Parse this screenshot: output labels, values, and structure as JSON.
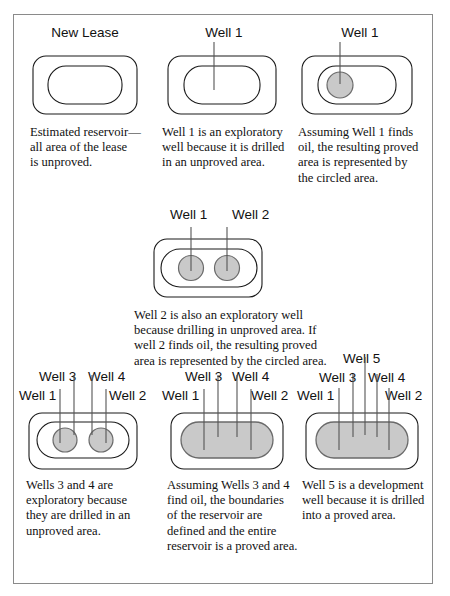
{
  "figure": {
    "frame_color": "#8a8a8a",
    "proved_fill_color": "#c9c9c9",
    "outline_color": "#1a1a1a"
  },
  "panels": [
    {
      "id": "new-lease",
      "headers": [
        "New Lease"
      ],
      "caption": "Estimated reservoir—all area of the lease is unproved.",
      "caption_lines": [
        "Estimated reservoir—",
        "all area of the lease",
        "is unproved."
      ],
      "wells": [],
      "proved_shape": "none"
    },
    {
      "id": "well-1-exploratory",
      "headers": [
        "Well 1"
      ],
      "caption": "Well 1 is an exploratory well because it is drilled in an unproved area.",
      "caption_lines": [
        "Well 1 is an exploratory",
        "well because it is drilled",
        "in an unproved area."
      ],
      "wells": [
        "Well 1"
      ],
      "proved_shape": "none"
    },
    {
      "id": "well-1-proved",
      "headers": [
        "Well 1"
      ],
      "caption": "Assuming Well 1 finds oil, the resulting proved area is represented by the circled area.",
      "caption_lines": [
        "Assuming Well 1 finds",
        "oil, the resulting proved",
        "area is represented by",
        "the circled area."
      ],
      "wells": [
        "Well 1"
      ],
      "proved_shape": "single-circle"
    },
    {
      "id": "well-2-proved",
      "headers": [
        "Well 1",
        "Well 2"
      ],
      "caption": "Well 2 is also an exploratory well because drilling in unproved area. If well 2 finds oil, the resulting proved area is represented by the circled area.",
      "caption_lines": [
        "Well 2 is also an exploratory  well",
        "because drilling in unproved area. If",
        "well 2 finds oil, the resulting proved",
        "area is represented by the circled area."
      ],
      "wells": [
        "Well 1",
        "Well 2"
      ],
      "proved_shape": "two-circles"
    },
    {
      "id": "wells-3-4-exploratory",
      "headers_row1": [
        "Well 3",
        "Well 4"
      ],
      "headers_row2": [
        "Well 1",
        "Well 2"
      ],
      "caption": "Wells 3 and 4 are exploratory because they are drilled in an unproved area.",
      "caption_lines": [
        "Wells 3 and 4 are",
        "exploratory because",
        "they are drilled in an",
        "unproved area."
      ],
      "wells": [
        "Well 1",
        "Well 3",
        "Well 4",
        "Well 2"
      ],
      "proved_shape": "two-circles"
    },
    {
      "id": "wells-3-4-proved",
      "headers_row1": [
        "Well 3",
        "Well 4"
      ],
      "headers_row2": [
        "Well 1",
        "Well 2"
      ],
      "caption": "Assuming Wells 3 and 4 find oil, the boundaries of the reservoir are defined and the entire reservoir is a proved area.",
      "caption_lines": [
        "Assuming Wells 3 and 4",
        "find oil, the boundaries",
        "of the reservoir are",
        "defined and the entire",
        "reservoir is a proved area."
      ],
      "wells": [
        "Well 1",
        "Well 3",
        "Well 4",
        "Well 2"
      ],
      "proved_shape": "full-reservoir"
    },
    {
      "id": "well-5-development",
      "headers_row0": [
        "Well 5"
      ],
      "headers_row1": [
        "Well 3",
        "Well 4"
      ],
      "headers_row2": [
        "Well 1",
        "Well 2"
      ],
      "caption": "Well 5 is a development well because it is drilled into a proved area.",
      "caption_lines": [
        "Well 5 is a development",
        "well because it is drilled",
        "into a proved area."
      ],
      "wells": [
        "Well 1",
        "Well 3",
        "Well 5",
        "Well 4",
        "Well 2"
      ],
      "proved_shape": "full-reservoir"
    }
  ]
}
